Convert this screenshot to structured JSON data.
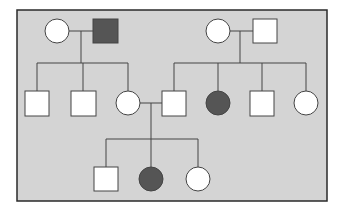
{
  "diagram": {
    "type": "pedigree-chart",
    "background_color": "#d4d4d4",
    "border_color": "#2a2a2a",
    "affected_color": "#555555",
    "unaffected_color": "#ffffff",
    "line_color": "#444444",
    "generations": [
      {
        "index": 1,
        "individuals": [
          {
            "id": "I-1",
            "sex": "female",
            "affected": false
          },
          {
            "id": "I-2",
            "sex": "male",
            "affected": true
          },
          {
            "id": "I-3",
            "sex": "female",
            "affected": false
          },
          {
            "id": "I-4",
            "sex": "male",
            "affected": false
          }
        ]
      },
      {
        "index": 2,
        "individuals": [
          {
            "id": "II-1",
            "sex": "male",
            "affected": false
          },
          {
            "id": "II-2",
            "sex": "male",
            "affected": false
          },
          {
            "id": "II-3",
            "sex": "female",
            "affected": false
          },
          {
            "id": "II-4",
            "sex": "male",
            "affected": false
          },
          {
            "id": "II-5",
            "sex": "female",
            "affected": true
          },
          {
            "id": "II-6",
            "sex": "male",
            "affected": false
          },
          {
            "id": "II-7",
            "sex": "female",
            "affected": false
          }
        ]
      },
      {
        "index": 3,
        "individuals": [
          {
            "id": "III-1",
            "sex": "male",
            "affected": false
          },
          {
            "id": "III-2",
            "sex": "female",
            "affected": true
          },
          {
            "id": "III-3",
            "sex": "female",
            "affected": false
          }
        ]
      }
    ],
    "matings": [
      {
        "partners": [
          "I-1",
          "I-2"
        ],
        "children": [
          "II-1",
          "II-2",
          "II-3"
        ]
      },
      {
        "partners": [
          "I-3",
          "I-4"
        ],
        "children": [
          "II-4",
          "II-5",
          "II-6",
          "II-7"
        ]
      },
      {
        "partners": [
          "II-3",
          "II-4"
        ],
        "children": [
          "III-1",
          "III-2",
          "III-3"
        ]
      }
    ]
  }
}
